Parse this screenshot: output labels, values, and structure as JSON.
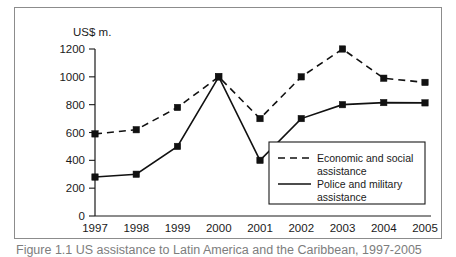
{
  "chart_data": {
    "type": "line",
    "title": "",
    "xlabel": "",
    "ylabel": "US$ m.",
    "categories": [
      "1997",
      "1998",
      "1999",
      "2000",
      "2001",
      "2002",
      "2003",
      "2004",
      "2005"
    ],
    "series": [
      {
        "name": "Economic and social assistance",
        "style": "dashed",
        "marker": "square",
        "color": "#111111",
        "values": [
          590,
          620,
          780,
          1000,
          700,
          1000,
          1200,
          990,
          960
        ]
      },
      {
        "name": "Police and military assistance",
        "style": "solid",
        "marker": "square",
        "color": "#111111",
        "values": [
          280,
          300,
          500,
          1000,
          400,
          700,
          800,
          815,
          813
        ]
      }
    ],
    "ylim": [
      0,
      1200
    ],
    "yticks": [
      0,
      200,
      400,
      600,
      800,
      1000,
      1200
    ],
    "ytick_labels": [
      "0",
      "200",
      "400",
      "600",
      "800",
      "1000",
      "1200"
    ],
    "grid": false,
    "legend_position": "inside-lower-right"
  },
  "legend": {
    "entries": [
      {
        "label_line1": "Economic and social",
        "label_line2": "assistance",
        "style": "dashed"
      },
      {
        "label_line1": "Police and military",
        "label_line2": "assistance",
        "style": "solid"
      }
    ]
  },
  "caption": {
    "text": "Figure 1.1  US assistance to Latin America and the Caribbean, 1997-2005"
  }
}
